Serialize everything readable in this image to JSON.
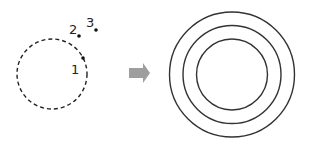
{
  "diagram": {
    "left": {
      "description": "dashed circle with three points",
      "points": [
        {
          "label": "1",
          "position": "on circle"
        },
        {
          "label": "2",
          "position": "outside circle"
        },
        {
          "label": "3",
          "position": "outside circle"
        }
      ]
    },
    "arrow": {
      "direction": "right",
      "color": "#9e9e9e"
    },
    "right": {
      "description": "three concentric solid circles",
      "rings": 3
    }
  }
}
